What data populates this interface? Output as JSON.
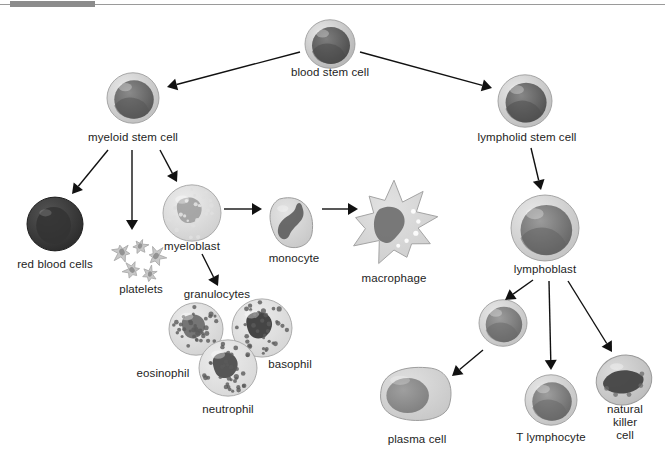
{
  "figure": {
    "background": "#ffffff",
    "width": 665,
    "height": 468
  },
  "decor": {
    "top_rule_color": "#9a9a9a",
    "top_rule_tab_color": "#8c8c8c"
  },
  "nodes": [
    {
      "id": "blood-stem-cell",
      "label": "blood stem cell",
      "x": 330,
      "y": 44,
      "cx": 330,
      "cy": 44,
      "label_x": 330,
      "label_y": 71,
      "shape": "round-cell",
      "r": 25,
      "fill": "#7d7d7d",
      "rim": "#b9b9b9",
      "nucleus": "#4a4a4a"
    },
    {
      "id": "myeloid-stem-cell",
      "label": "myeloid stem cell",
      "x": 133,
      "y": 98,
      "cx": 133,
      "cy": 98,
      "label_x": 133,
      "label_y": 136,
      "shape": "round-cell",
      "r": 26,
      "fill": "#8a8a8a",
      "rim": "#c2c2c2",
      "nucleus": "#565656"
    },
    {
      "id": "lymphoid-stem-cell",
      "label": "lympholid stem cell",
      "x": 525,
      "y": 101,
      "cx": 525,
      "cy": 101,
      "label_x": 525,
      "label_y": 138,
      "shape": "round-cell",
      "r": 27,
      "fill": "#878787",
      "rim": "#c0c0c0",
      "nucleus": "#4f4f4f"
    },
    {
      "id": "red-blood-cells",
      "label": "red blood cells",
      "x": 55,
      "y": 224,
      "cx": 55,
      "cy": 224,
      "label_x": 55,
      "label_y": 263,
      "shape": "rbc",
      "r": 28,
      "fill": "#3a3a3a",
      "rim": "#2b2b2b",
      "nucleus": "#2f2f2f"
    },
    {
      "id": "platelets",
      "label": "platelets",
      "x": 140,
      "y": 258,
      "cx": 140,
      "cy": 258,
      "label_x": 140,
      "label_y": 286,
      "shape": "platelets",
      "r": 22,
      "fill": "#c8c8c8",
      "rim": "#a8a8a8",
      "nucleus": "#8a8a8a"
    },
    {
      "id": "myeloblast",
      "label": "myeloblast",
      "x": 192,
      "y": 213,
      "cx": 192,
      "cy": 213,
      "label_x": 192,
      "label_y": 247,
      "shape": "granular",
      "r": 29,
      "fill": "#bdbdbd",
      "rim": "#cfcfcf",
      "nucleus": "#8f8f8f"
    },
    {
      "id": "monocyte",
      "label": "monocyte",
      "x": 294,
      "y": 222,
      "cx": 294,
      "cy": 222,
      "label_x": 294,
      "label_y": 258,
      "shape": "monocyte",
      "r": 28,
      "fill": "#b5b5b5",
      "rim": "#c8c8c8",
      "nucleus": "#5e5e5e"
    },
    {
      "id": "macrophage",
      "label": "macrophage",
      "x": 394,
      "y": 224,
      "cx": 394,
      "cy": 224,
      "label_x": 394,
      "label_y": 277,
      "shape": "macrophage",
      "r": 42,
      "fill": "#bcbcbc",
      "rim": "#cdcdcd",
      "nucleus": "#6d6d6d"
    },
    {
      "id": "granulocytes",
      "label": "granulocytes",
      "x": 216,
      "y": 294,
      "cx": 216,
      "cy": 294,
      "label_x": 216,
      "label_y": 294,
      "shape": "label-only",
      "r": 0,
      "fill": "#000000",
      "rim": "#000000",
      "nucleus": "#000000"
    },
    {
      "id": "eosinophil",
      "label": "eosinophil",
      "x": 196,
      "y": 329,
      "cx": 196,
      "cy": 329,
      "label_x": 163,
      "label_y": 373,
      "shape": "granular-dark",
      "r": 27,
      "fill": "#c6c6c6",
      "rim": "#d2d2d2",
      "nucleus": "#6f6f6f"
    },
    {
      "id": "basophil",
      "label": "basophil",
      "x": 262,
      "y": 328,
      "cx": 262,
      "cy": 328,
      "label_x": 289,
      "label_y": 366,
      "shape": "granular-dark",
      "r": 30,
      "fill": "#c9c9c9",
      "rim": "#d5d5d5",
      "nucleus": "#3c3c3c"
    },
    {
      "id": "neutrophil",
      "label": "neutrophil",
      "x": 228,
      "y": 368,
      "cx": 228,
      "cy": 368,
      "label_x": 227,
      "label_y": 410,
      "shape": "granular-dark",
      "r": 29,
      "fill": "#cccccc",
      "rim": "#d8d8d8",
      "nucleus": "#4e4e4e"
    },
    {
      "id": "lymphoblast",
      "label": "lymphoblast",
      "x": 545,
      "y": 228,
      "cx": 545,
      "cy": 228,
      "label_x": 545,
      "label_y": 269,
      "shape": "round-cell",
      "r": 34,
      "fill": "#9b9b9b",
      "rim": "#c6c6c6",
      "nucleus": "#636363"
    },
    {
      "id": "plasma-cell",
      "label": "plasma cell",
      "x": 416,
      "y": 394,
      "cx": 416,
      "cy": 394,
      "label_x": 416,
      "label_y": 438,
      "shape": "plasma",
      "r": 38,
      "fill": "#b0b0b0",
      "rim": "#c7c7c7",
      "nucleus": "#7e7e7e"
    },
    {
      "id": "b-lymphocyte",
      "label": "",
      "x": 503,
      "y": 323,
      "cx": 503,
      "cy": 323,
      "label_x": 503,
      "label_y": 323,
      "shape": "round-cell",
      "r": 24,
      "fill": "#9d9d9d",
      "rim": "#c5c5c5",
      "nucleus": "#6a6a6a"
    },
    {
      "id": "t-lymphocyte",
      "label": "T lymphocyte",
      "x": 551,
      "y": 400,
      "cx": 551,
      "cy": 400,
      "label_x": 551,
      "label_y": 437,
      "shape": "round-cell",
      "r": 26,
      "fill": "#9e9e9e",
      "rim": "#c5c5c5",
      "nucleus": "#676767"
    },
    {
      "id": "natural-killer-cell",
      "label": "natural\nkiller cell",
      "x": 624,
      "y": 380,
      "cx": 624,
      "cy": 380,
      "label_x": 624,
      "label_y": 409,
      "shape": "nk",
      "r": 28,
      "fill": "#8d8d8d",
      "rim": "#bcbcbc",
      "nucleus": "#3f3f3f"
    }
  ],
  "labels": {
    "blood_stem_cell": "blood stem cell",
    "myeloid_stem_cell": "myeloid stem cell",
    "lymphoid_stem_cell": "lympholid stem cell",
    "red_blood_cells": "red blood cells",
    "platelets": "platelets",
    "myeloblast": "myeloblast",
    "monocyte": "monocyte",
    "macrophage": "macrophage",
    "granulocytes": "granulocytes",
    "eosinophil": "eosinophil",
    "basophil": "basophil",
    "neutrophil": "neutrophil",
    "lymphoblast": "lymphoblast",
    "plasma_cell": "plasma cell",
    "t_lymphocyte": "T lymphocyte",
    "natural_killer_cell_line1": "natural",
    "natural_killer_cell_line2": "killer cell"
  },
  "arrows": [
    {
      "id": "arrow-bsc-to-myeloid",
      "from": "blood-stem-cell",
      "to": "myeloid-stem-cell",
      "x1": 300,
      "y1": 52,
      "x2": 167,
      "y2": 87
    },
    {
      "id": "arrow-bsc-to-lymphoid",
      "from": "blood-stem-cell",
      "to": "lymphoid-stem-cell",
      "x1": 360,
      "y1": 52,
      "x2": 492,
      "y2": 88
    },
    {
      "id": "arrow-myeloid-to-rbc",
      "from": "myeloid-stem-cell",
      "to": "red-blood-cells",
      "x1": 108,
      "y1": 150,
      "x2": 72,
      "y2": 194
    },
    {
      "id": "arrow-myeloid-to-platelets",
      "from": "myeloid-stem-cell",
      "to": "platelets",
      "x1": 132,
      "y1": 150,
      "x2": 132,
      "y2": 230
    },
    {
      "id": "arrow-myeloid-to-myeloblast",
      "from": "myeloid-stem-cell",
      "to": "myeloblast",
      "x1": 160,
      "y1": 150,
      "x2": 177,
      "y2": 182
    },
    {
      "id": "arrow-myeloblast-to-monocyte",
      "from": "myeloblast",
      "to": "monocyte",
      "x1": 224,
      "y1": 209,
      "x2": 262,
      "y2": 209
    },
    {
      "id": "arrow-monocyte-to-macrophage",
      "from": "monocyte",
      "to": "macrophage",
      "x1": 322,
      "y1": 209,
      "x2": 358,
      "y2": 209
    },
    {
      "id": "arrow-myeloblast-to-granulo",
      "from": "myeloblast",
      "to": "granulocytes",
      "x1": 202,
      "y1": 254,
      "x2": 218,
      "y2": 286
    },
    {
      "id": "arrow-lymphoid-to-lymphoblast",
      "from": "lymphoid-stem-cell",
      "to": "lymphoblast",
      "x1": 531,
      "y1": 148,
      "x2": 541,
      "y2": 190
    },
    {
      "id": "arrow-lymphoblast-to-b",
      "from": "lymphoblast",
      "to": "b-lymphocyte",
      "x1": 533,
      "y1": 280,
      "x2": 505,
      "y2": 300
    },
    {
      "id": "arrow-b-to-plasma",
      "from": "b-lymphocyte",
      "to": "plasma-cell",
      "x1": 483,
      "y1": 350,
      "x2": 452,
      "y2": 376
    },
    {
      "id": "arrow-lymphoblast-to-t",
      "from": "lymphoblast",
      "to": "t-lymphocyte",
      "x1": 549,
      "y1": 281,
      "x2": 551,
      "y2": 370
    },
    {
      "id": "arrow-lymphoblast-to-nk",
      "from": "lymphoblast",
      "to": "natural-killer-cell",
      "x1": 568,
      "y1": 281,
      "x2": 612,
      "y2": 352
    }
  ],
  "arrow_style": {
    "stroke": "#111111",
    "stroke_width": 1.4,
    "head_length": 10,
    "head_width": 6
  }
}
